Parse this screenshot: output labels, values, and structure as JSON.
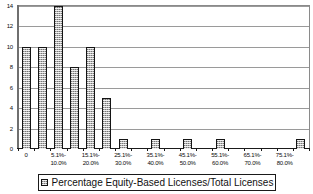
{
  "chart_data": {
    "type": "bar",
    "title": "",
    "xlabel": "",
    "ylabel": "",
    "ylim": [
      0,
      14
    ],
    "ytick_labels": [
      "0",
      "2",
      "4",
      "6",
      "8",
      "10",
      "12",
      "14"
    ],
    "ytick_values": [
      0,
      2,
      4,
      6,
      8,
      10,
      12,
      14
    ],
    "grid": true,
    "legend_position": "bottom",
    "legend": [
      "Percentage Equity-Based Licenses/Total Licenses"
    ],
    "categories": [
      "0",
      "",
      "5.1%-\n10.0%",
      "",
      "15.1%-\n20.0%",
      "",
      "25.1%-\n30.0%",
      "",
      "35.1%-\n40.0%",
      "",
      "45.1%-\n50.0%",
      "",
      "55.1%-\n60.0%",
      "",
      "65.1%-\n70.0%",
      "",
      "75.1%-\n80.0%",
      ""
    ],
    "visible_xtick_labels": [
      "0",
      "5.1%-\n10.0%",
      "15.1%-\n20.0%",
      "25.1%-\n30.0%",
      "35.1%-\n40.0%",
      "45.1%-\n50.0%",
      "55.1%-\n60.0%",
      "65.1%-\n70.0%",
      "75.1%-\n80.0%"
    ],
    "values": [
      10,
      10,
      14,
      8,
      10,
      5,
      1,
      0,
      1,
      0,
      1,
      0,
      1,
      0,
      0,
      0,
      0,
      1
    ],
    "series": [
      {
        "name": "Percentage Equity-Based Licenses/Total Licenses",
        "values": [
          10,
          10,
          14,
          8,
          10,
          5,
          1,
          0,
          1,
          0,
          1,
          0,
          1,
          0,
          0,
          0,
          0,
          1
        ]
      }
    ],
    "colors": {
      "bar_fill": "#b4b4b4",
      "bar_border": "#141414",
      "gridline": "#9a9a9a",
      "axis": "#1a1a1a",
      "text": "#0b0b0b",
      "background": "#ffffff"
    }
  },
  "legend": {
    "label": "Percentage Equity-Based Licenses/Total Licenses"
  }
}
